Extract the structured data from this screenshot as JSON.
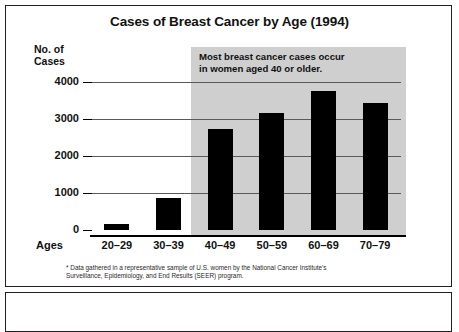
{
  "figure": {
    "title": "Cases of Breast Cancer by Age (1994)",
    "y_axis_label_line1": "No. of",
    "y_axis_label_line2": "Cases",
    "ages_word": "Ages",
    "callout_line1": "Most breast cancer cases occur",
    "callout_line2": "in women aged 40 or older.",
    "footnote_line1": "* Data gathered in a representative sample of U.S. women by the National Cancer Institute's",
    "footnote_line2": "Surveillance, Epidemiology, and End Results (SEER) program.",
    "shade_color": "#cfcfcf",
    "bar_color": "#000000",
    "border_color": "#231f20"
  },
  "chart_data": {
    "type": "bar",
    "title": "Cases of Breast Cancer by Age (1994)",
    "xlabel": "Ages",
    "ylabel": "No. of Cases",
    "categories": [
      "20–29",
      "30–39",
      "40–49",
      "50–59",
      "60–69",
      "70–79"
    ],
    "values": [
      150,
      870,
      2720,
      3150,
      3750,
      3440
    ],
    "ylim": [
      0,
      4000
    ],
    "yticks": [
      0,
      1000,
      2000,
      3000,
      4000
    ],
    "ytick_labels": [
      "0",
      "1000",
      "2000",
      "3000",
      "4000"
    ],
    "grid": true,
    "legend": "none",
    "annotations": [
      {
        "text": "Most breast cancer cases occur in women aged 40 or older.",
        "covers_categories": [
          "40–49",
          "50–59",
          "60–69",
          "70–79"
        ]
      },
      {
        "text": "* Data gathered in a representative sample of U.S. women by the National Cancer Institute's Surveillance, Epidemiology, and End Results (SEER) program."
      }
    ]
  }
}
